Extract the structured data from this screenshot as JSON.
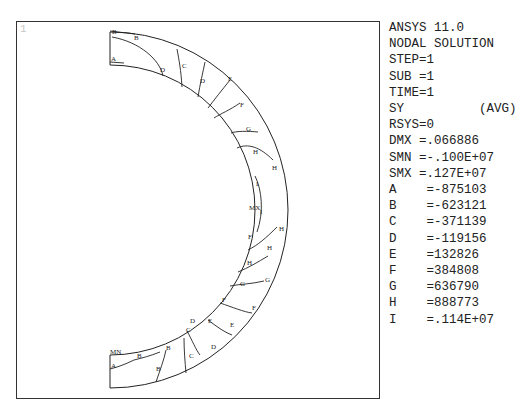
{
  "window": {
    "number": "1"
  },
  "header": {
    "product": "ANSYS 11.0",
    "solution_type": "NODAL SOLUTION",
    "step": "STEP=1",
    "sub": "SUB =1",
    "time": "TIME=1",
    "item": "SY          (AVG)",
    "rsys": "RSYS=0",
    "dmx": "DMX =.066886",
    "smn": "SMN =-.100E+07",
    "smx": "SMX =.127E+07"
  },
  "legend": {
    "levels": [
      {
        "label": "A",
        "text": "A    =-875103",
        "value": -875103
      },
      {
        "label": "B",
        "text": "B    =-623121",
        "value": -623121
      },
      {
        "label": "C",
        "text": "C    =-371139",
        "value": -371139
      },
      {
        "label": "D",
        "text": "D    =-119156",
        "value": -119156
      },
      {
        "label": "E",
        "text": "E    =132826",
        "value": 132826
      },
      {
        "label": "F",
        "text": "F    =384808",
        "value": 384808
      },
      {
        "label": "G",
        "text": "G    =636790",
        "value": 636790
      },
      {
        "label": "H",
        "text": "H    =888773",
        "value": 888773
      },
      {
        "label": "I",
        "text": "I    =.114E+07",
        "value": 1140000
      }
    ]
  },
  "plot": {
    "markers": {
      "min": "MN",
      "max": "MX"
    },
    "contour_labels": [
      {
        "t": "B",
        "x": 112,
        "y": 34
      },
      {
        "t": "B",
        "x": 134,
        "y": 40
      },
      {
        "t": "A",
        "x": 111,
        "y": 61
      },
      {
        "t": "D",
        "x": 160,
        "y": 72
      },
      {
        "t": "C",
        "x": 182,
        "y": 68
      },
      {
        "t": "D",
        "x": 200,
        "y": 83
      },
      {
        "t": "E",
        "x": 228,
        "y": 81
      },
      {
        "t": "F",
        "x": 240,
        "y": 107
      },
      {
        "t": "G",
        "x": 246,
        "y": 131
      },
      {
        "t": "H",
        "x": 253,
        "y": 154
      },
      {
        "t": "H",
        "x": 272,
        "y": 170
      },
      {
        "t": "I",
        "x": 256,
        "y": 186
      },
      {
        "t": "MX",
        "x": 249,
        "y": 210
      },
      {
        "t": "I",
        "x": 260,
        "y": 214
      },
      {
        "t": "H",
        "x": 279,
        "y": 231
      },
      {
        "t": "H",
        "x": 267,
        "y": 250
      },
      {
        "t": "F",
        "x": 248,
        "y": 239
      },
      {
        "t": "H",
        "x": 247,
        "y": 265
      },
      {
        "t": "G",
        "x": 240,
        "y": 286
      },
      {
        "t": "G",
        "x": 265,
        "y": 282
      },
      {
        "t": "F",
        "x": 222,
        "y": 302
      },
      {
        "t": "F",
        "x": 252,
        "y": 310
      },
      {
        "t": "E",
        "x": 208,
        "y": 323
      },
      {
        "t": "E",
        "x": 230,
        "y": 327
      },
      {
        "t": "D",
        "x": 190,
        "y": 323
      },
      {
        "t": "C",
        "x": 186,
        "y": 332
      },
      {
        "t": "D",
        "x": 211,
        "y": 349
      },
      {
        "t": "B",
        "x": 166,
        "y": 350
      },
      {
        "t": "C",
        "x": 189,
        "y": 358
      },
      {
        "t": "B",
        "x": 137,
        "y": 358
      },
      {
        "t": "B",
        "x": 156,
        "y": 371
      },
      {
        "t": "A",
        "x": 111,
        "y": 368
      },
      {
        "t": "MN",
        "x": 110,
        "y": 354
      }
    ]
  },
  "colors": {
    "line": "#222222",
    "frame": "#333333",
    "text": "#222222",
    "window_number": "#c8c8c8"
  }
}
